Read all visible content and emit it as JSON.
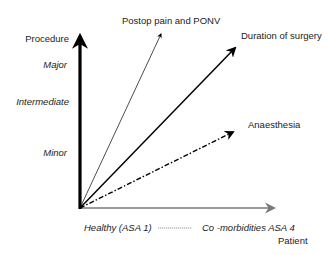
{
  "diagram": {
    "y_axis": {
      "title": "Procedure",
      "levels": [
        "Major",
        "Intermediate",
        "Minor"
      ]
    },
    "x_axis": {
      "start_label": "Healthy (ASA 1)",
      "separator": "-----------",
      "end_label": "Co -morbidities ASA 4",
      "title": "Patient"
    },
    "vectors": [
      {
        "label": "Postop pain and PONV",
        "style": "thin-solid"
      },
      {
        "label": "Duration of surgery",
        "style": "medium-solid"
      },
      {
        "label": "Anaesthesia",
        "style": "dash-dot"
      }
    ],
    "colors": {
      "y_axis": "#000000",
      "x_axis": "#7a7a7a",
      "vectors": "#000000",
      "text": "#222222"
    }
  }
}
